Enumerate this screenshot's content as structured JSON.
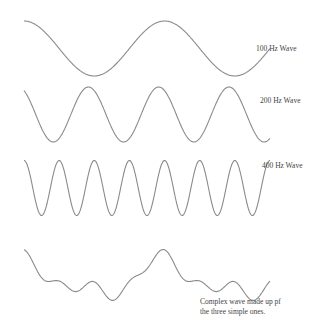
{
  "diagram": {
    "title": "",
    "stroke_color": "#8a8a8a",
    "text_color": "#444444",
    "waves": [
      {
        "id": "w100",
        "label": "100 Hz Wave",
        "frequency_hz": 100,
        "x_start": 24,
        "x_end": 270,
        "y_center": 48.5,
        "amplitude": 27.5,
        "cycles": 1.75,
        "phase_deg": 90,
        "label_x": 256,
        "label_y": 44
      },
      {
        "id": "w200",
        "label": "200 Hz Wave",
        "frequency_hz": 200,
        "x_start": 24,
        "x_end": 270,
        "y_center": 114.5,
        "amplitude": 27.5,
        "cycles": 3.5,
        "phase_deg": 120,
        "label_x": 260,
        "label_y": 96
      },
      {
        "id": "w400",
        "label": "400 Hz Wave",
        "frequency_hz": 400,
        "x_start": 24,
        "x_end": 270,
        "y_center": 188,
        "amplitude": 27.5,
        "cycles": 7,
        "phase_deg": 90,
        "label_x": 262,
        "label_y": 161
      }
    ],
    "complex": {
      "label_line1": "Complex wave made up pf",
      "label_line2": "the three simple ones.",
      "label_x": 200,
      "label_y": 297
    }
  }
}
